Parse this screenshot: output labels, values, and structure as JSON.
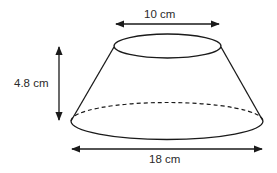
{
  "diagram": {
    "labels": {
      "top_diameter": "10 cm",
      "height": "4.8 cm",
      "bottom_diameter": "18 cm"
    },
    "dimensions": {
      "top_diameter_cm": 10,
      "bottom_diameter_cm": 18,
      "height_cm": 4.8
    },
    "colors": {
      "stroke": "#1a1a1a",
      "text": "#2a2a2a",
      "background": "#ffffff"
    }
  }
}
